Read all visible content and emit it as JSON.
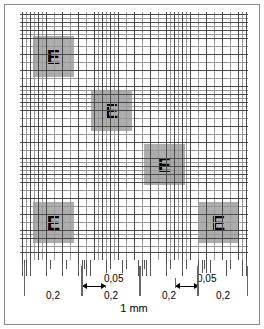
{
  "figure": {
    "background_color": "#ffffff",
    "frame_color": "#8a8a8a"
  },
  "grid": {
    "major_line_color": "#4a4a4a",
    "minor_line_color": "#9a9a9a",
    "square_fill": "#969696",
    "cell_label": "E",
    "cells": [
      {
        "name": "e-square-top-left",
        "label": "E",
        "x": 13,
        "y": 24
      },
      {
        "name": "e-square-upper-middle",
        "label": "E",
        "x": 71,
        "y": 78
      },
      {
        "name": "e-square-lower-middle",
        "label": "E",
        "x": 124,
        "y": 132
      },
      {
        "name": "e-square-bottom-left",
        "label": "E",
        "x": 13,
        "y": 190
      },
      {
        "name": "e-square-bottom-right",
        "label": "E",
        "x": 178,
        "y": 190
      }
    ],
    "vertical_major_positions": [
      2,
      10,
      18,
      26,
      42,
      58,
      74,
      82,
      90,
      98,
      114,
      130,
      146,
      154,
      162,
      170,
      186,
      202,
      218,
      226
    ],
    "vertical_minor_positions": [
      6,
      14,
      22,
      34,
      50,
      66,
      78,
      86,
      94,
      106,
      122,
      138,
      150,
      158,
      166,
      178,
      194,
      210,
      222
    ],
    "horizontal_major_positions": [
      2,
      10,
      18,
      26,
      42,
      58,
      74,
      82,
      90,
      98,
      114,
      130,
      146,
      154,
      162,
      170,
      186,
      202,
      218,
      226,
      240
    ],
    "horizontal_minor_positions": [
      6,
      14,
      22,
      34,
      50,
      66,
      78,
      86,
      94,
      106,
      122,
      138,
      150,
      158,
      166,
      178,
      194,
      210,
      222,
      234
    ]
  },
  "dimensions": {
    "segments": [
      {
        "name": "dim-0-2-first",
        "label": "0,2",
        "x": 4,
        "width": 58
      },
      {
        "name": "dim-0-2-second",
        "label": "0,2",
        "x": 62,
        "width": 58
      },
      {
        "name": "dim-0-2-third",
        "label": "0,2",
        "x": 120,
        "width": 58
      },
      {
        "name": "dim-0-2-fourth",
        "label": "0,2",
        "x": 178,
        "width": 50
      }
    ],
    "fine_segments": [
      {
        "name": "dim-0-05-first",
        "label": "0,05",
        "x": 62,
        "width": 24,
        "label_x": 84
      },
      {
        "name": "dim-0-05-second",
        "label": "0,05",
        "x": 155,
        "width": 24,
        "label_x": 177
      }
    ],
    "total": {
      "name": "dim-total-width",
      "label": "1 mm"
    }
  },
  "ruler": {
    "tick_color": "#555555",
    "long_tick_positions": [
      2,
      6,
      10,
      26,
      42,
      58,
      62,
      66,
      70,
      86,
      102,
      118,
      122,
      126,
      130,
      146,
      162,
      178,
      182,
      186,
      190,
      206,
      222,
      226
    ],
    "short_tick_positions": [
      4,
      30,
      46,
      64,
      90,
      106,
      124,
      150,
      166,
      184,
      210,
      226
    ]
  }
}
